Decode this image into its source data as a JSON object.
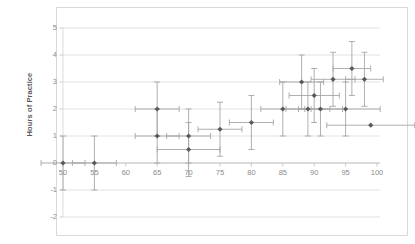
{
  "chart_data": {
    "type": "scatter",
    "title": "",
    "xlabel": "",
    "ylabel": "Hours of Practice",
    "xlim": [
      50,
      100
    ],
    "ylim": [
      -2,
      5
    ],
    "xticks": [
      50,
      55,
      60,
      65,
      70,
      75,
      80,
      85,
      90,
      95,
      100
    ],
    "yticks": [
      -2,
      -1,
      0,
      1,
      2,
      3,
      4,
      5
    ],
    "grid": true,
    "legend": false,
    "marker_color": "#595959",
    "errorbar_color": "#a6a6a6",
    "gridline_color": "#d9d9d9",
    "axis_color": "#a6a6a6",
    "background": "#ffffff",
    "points": [
      {
        "x": 50,
        "y": 0,
        "xerr": 3.5,
        "yerr": 1.0
      },
      {
        "x": 55,
        "y": 0,
        "xerr": 3.5,
        "yerr": 1.0
      },
      {
        "x": 65,
        "y": 2.0,
        "xerr": 3.5,
        "yerr": 1.0
      },
      {
        "x": 65,
        "y": 1.0,
        "xerr": 3.5,
        "yerr": 1.0
      },
      {
        "x": 70,
        "y": 1.0,
        "xerr": 3.5,
        "yerr": 1.0
      },
      {
        "x": 70,
        "y": 0.5,
        "xerr": 5.0,
        "yerr": 1.0
      },
      {
        "x": 75,
        "y": 1.25,
        "xerr": 3.5,
        "yerr": 1.0
      },
      {
        "x": 80,
        "y": 1.5,
        "xerr": 3.5,
        "yerr": 1.0
      },
      {
        "x": 85,
        "y": 2.0,
        "xerr": 3.5,
        "yerr": 1.0
      },
      {
        "x": 88,
        "y": 3.0,
        "xerr": 3.5,
        "yerr": 1.0
      },
      {
        "x": 89,
        "y": 2.0,
        "xerr": 3.5,
        "yerr": 1.0
      },
      {
        "x": 90,
        "y": 2.5,
        "xerr": 4.0,
        "yerr": 1.0
      },
      {
        "x": 91,
        "y": 2.0,
        "xerr": 3.5,
        "yerr": 1.0
      },
      {
        "x": 93,
        "y": 3.1,
        "xerr": 3.5,
        "yerr": 1.0
      },
      {
        "x": 95,
        "y": 2.0,
        "xerr": 5.5,
        "yerr": 1.0
      },
      {
        "x": 96,
        "y": 3.5,
        "xerr": 3.0,
        "yerr": 1.0
      },
      {
        "x": 98,
        "y": 3.1,
        "xerr": 3.0,
        "yerr": 1.0
      },
      {
        "x": 99,
        "y": 1.4,
        "xerr": 7.0,
        "yerr": 0.0
      }
    ]
  }
}
